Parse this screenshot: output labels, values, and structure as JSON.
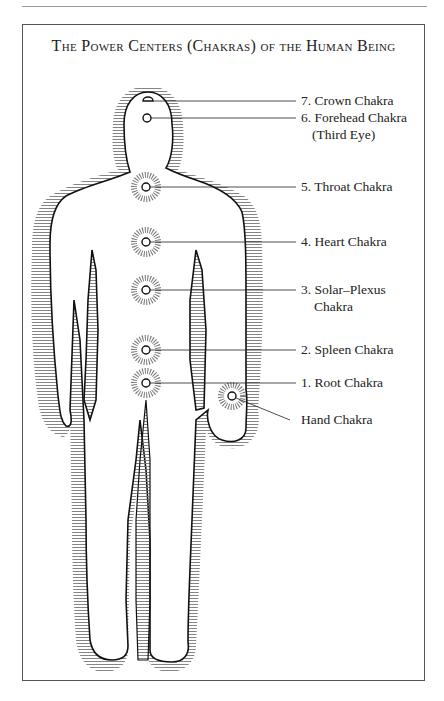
{
  "figure": {
    "title": "The Power Centers (Chakras) of the Human Being"
  },
  "chakras": [
    {
      "label": "7. Crown Chakra",
      "x": 148,
      "y": 101
    },
    {
      "label": "6. Forehead Chakra",
      "sub": "(Third Eye)",
      "x": 148,
      "y": 118
    },
    {
      "label": "5. Throat Chakra",
      "x": 146,
      "y": 187
    },
    {
      "label": "4. Heart Chakra",
      "x": 146,
      "y": 242
    },
    {
      "label": "3. Solar–Plexus",
      "sub": "Chakra",
      "x": 146,
      "y": 290
    },
    {
      "label": "2. Spleen Chakra",
      "x": 146,
      "y": 350
    },
    {
      "label": "1. Root Chakra",
      "x": 146,
      "y": 383
    },
    {
      "label": "Hand Chakra",
      "x": 232,
      "y": 396
    }
  ]
}
